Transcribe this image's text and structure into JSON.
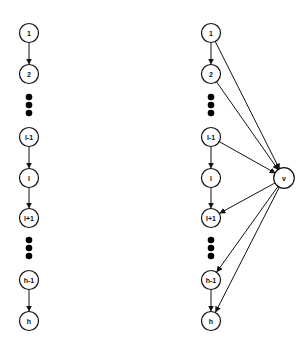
{
  "diagram": {
    "left_graph": {
      "nodes": [
        {
          "id": "1",
          "label": "1",
          "x": 29,
          "y": 33
        },
        {
          "id": "2",
          "label": "2",
          "x": 29,
          "y": 74
        },
        {
          "id": "l-1",
          "label": "l-1",
          "x": 29,
          "y": 137
        },
        {
          "id": "l",
          "label": "l",
          "x": 29,
          "y": 178
        },
        {
          "id": "l+1",
          "label": "l+1",
          "x": 29,
          "y": 218
        },
        {
          "id": "h-1",
          "label": "h-1",
          "x": 29,
          "y": 280
        },
        {
          "id": "h",
          "label": "h",
          "x": 29,
          "y": 321
        }
      ],
      "ellipsis_groups": [
        {
          "x": 29,
          "ys": [
            97,
            105,
            113
          ]
        },
        {
          "x": 29,
          "ys": [
            240,
            248,
            256
          ]
        }
      ],
      "edges": [
        [
          "1",
          "2"
        ],
        [
          "l-1",
          "l"
        ],
        [
          "l",
          "l+1"
        ],
        [
          "h-1",
          "h"
        ]
      ]
    },
    "right_graph": {
      "nodes": [
        {
          "id": "1",
          "label": "1",
          "x": 211,
          "y": 33
        },
        {
          "id": "2",
          "label": "2",
          "x": 211,
          "y": 74
        },
        {
          "id": "l-1",
          "label": "l-1",
          "x": 211,
          "y": 137
        },
        {
          "id": "l",
          "label": "l",
          "x": 211,
          "y": 178
        },
        {
          "id": "l+1",
          "label": "l+1",
          "x": 211,
          "y": 218
        },
        {
          "id": "h-1",
          "label": "h-1",
          "x": 211,
          "y": 280
        },
        {
          "id": "h",
          "label": "h",
          "x": 211,
          "y": 321
        },
        {
          "id": "v",
          "label": "v",
          "x": 284,
          "y": 178
        }
      ],
      "ellipsis_groups": [
        {
          "x": 211,
          "ys": [
            97,
            105,
            113
          ]
        },
        {
          "x": 211,
          "ys": [
            240,
            248,
            256
          ]
        }
      ],
      "edges": [
        [
          "1",
          "2"
        ],
        [
          "l-1",
          "l"
        ],
        [
          "l",
          "l+1"
        ],
        [
          "h-1",
          "h"
        ],
        [
          "1",
          "v"
        ],
        [
          "2",
          "v"
        ],
        [
          "l-1",
          "v"
        ],
        [
          "v",
          "l+1"
        ],
        [
          "v",
          "h-1"
        ],
        [
          "v",
          "h"
        ]
      ]
    },
    "node_radius": 9.5
  }
}
